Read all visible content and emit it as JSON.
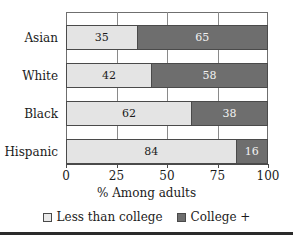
{
  "chart_data": {
    "type": "bar",
    "orientation": "horizontal",
    "stacked": true,
    "title": "",
    "xlabel": "% Among adults",
    "ylabel": "",
    "xlim": [
      0,
      100
    ],
    "xticks": [
      "0",
      "25",
      "50",
      "75",
      "100"
    ],
    "grid": "vertical",
    "legend_position": "bottom",
    "categories": [
      "Asian",
      "White",
      "Black",
      "Hispanic"
    ],
    "series": [
      {
        "name": "Less than college",
        "color": "#e4e4e4",
        "values": [
          35,
          42,
          62,
          84
        ]
      },
      {
        "name": "College +",
        "color": "#6e6e6e",
        "values": [
          65,
          58,
          38,
          16
        ]
      }
    ],
    "rows": [
      {
        "category": "Asian",
        "less_than_college": 35,
        "college_plus": 65
      },
      {
        "category": "White",
        "less_than_college": 42,
        "college_plus": 58
      },
      {
        "category": "Black",
        "less_than_college": 62,
        "college_plus": 38
      },
      {
        "category": "Hispanic",
        "less_than_college": 84,
        "college_plus": 16
      }
    ]
  },
  "colors": {
    "light_segment": "#e4e4e4",
    "dark_segment": "#6e6e6e",
    "frame": "#6f6f6f",
    "text": "#1b1b1b"
  }
}
